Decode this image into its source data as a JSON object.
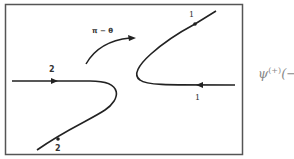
{
  "diagram": {
    "arc_label": "π − θ",
    "labels": {
      "upper_right": "1",
      "lower_right": "1",
      "upper_left": "2",
      "lower_left": "2"
    },
    "side_text": {
      "symbol": "ψ",
      "superscript": "(+)",
      "suffix": "(−"
    }
  }
}
